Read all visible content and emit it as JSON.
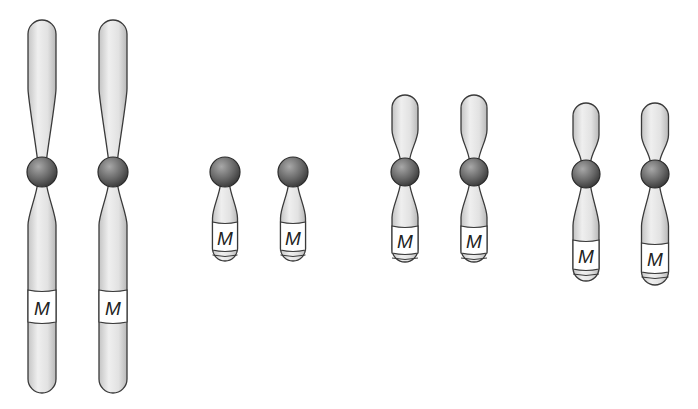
{
  "diagram": {
    "type": "chromosome-comparison",
    "marker_label": "M",
    "colors": {
      "arm_fill_light": "#efefef",
      "arm_fill_dark": "#bdbdbd",
      "centromere_light": "#9a9a9a",
      "centromere_dark": "#3b3b3b",
      "outline": "#3a3a3a",
      "band_fill": "#ffffff"
    },
    "groups": [
      {
        "name": "group-1-long-submetacentric",
        "chromosomes": [
          {
            "cx": 42,
            "width": 28,
            "top": 20,
            "centromere_y": 172,
            "centromere_r": 15,
            "bottom": 393,
            "band_top": 290,
            "band_bottom": 322,
            "label": "M"
          },
          {
            "cx": 113,
            "width": 28,
            "top": 20,
            "centromere_y": 172,
            "centromere_r": 15,
            "bottom": 393,
            "band_top": 290,
            "band_bottom": 322,
            "label": "M"
          }
        ]
      },
      {
        "name": "group-2-acrocentric",
        "chromosomes": [
          {
            "cx": 225,
            "width": 25,
            "top": null,
            "centromere_y": 172,
            "centromere_r": 15,
            "bottom": 261,
            "band_top": 222,
            "band_bottom": 250,
            "label": "M"
          },
          {
            "cx": 293,
            "width": 25,
            "top": null,
            "centromere_y": 172,
            "centromere_r": 15,
            "bottom": 261,
            "band_top": 222,
            "band_bottom": 250,
            "label": "M"
          }
        ]
      },
      {
        "name": "group-3-metacentric-small",
        "chromosomes": [
          {
            "cx": 405,
            "width": 26,
            "top": 95,
            "centromere_y": 172,
            "centromere_r": 14,
            "bottom": 262,
            "band_top": 226,
            "band_bottom": 253,
            "label": "M"
          },
          {
            "cx": 474,
            "width": 26,
            "top": 95,
            "centromere_y": 172,
            "centromere_r": 14,
            "bottom": 262,
            "band_top": 226,
            "band_bottom": 253,
            "label": "M"
          }
        ]
      },
      {
        "name": "group-4-metacentric-longer-q",
        "chromosomes": [
          {
            "cx": 586,
            "width": 26,
            "top": 103,
            "centromere_y": 174,
            "centromere_r": 14,
            "bottom": 281,
            "band_top": 240,
            "band_bottom": 269,
            "label": "M"
          },
          {
            "cx": 655,
            "width": 27,
            "top": 103,
            "centromere_y": 174,
            "centromere_r": 14,
            "bottom": 285,
            "band_top": 243,
            "band_bottom": 272,
            "label": "M"
          }
        ]
      }
    ]
  }
}
